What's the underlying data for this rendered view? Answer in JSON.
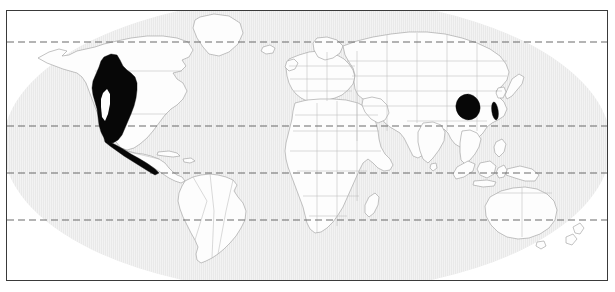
{
  "figure": {
    "type": "distribution-map",
    "title": "",
    "caption": "",
    "projection": "Robinson-like elliptical world projection",
    "background_color": "#ffffff",
    "ocean_color": "#e9e9e9",
    "land_color": "#fdfdfd",
    "land_outline_color": "#9a9a9a",
    "country_border_color": "#b4b4b4",
    "range_color": "#070707",
    "frame_color": "#3a3a3a"
  },
  "graticule": {
    "style": "dashed",
    "color": "#6b6b6b",
    "lines": [
      {
        "name": "arctic-circle",
        "label": "66.5°N",
        "y": 31
      },
      {
        "name": "tropic-of-cancer",
        "label": "23.5°N",
        "y": 115
      },
      {
        "name": "equator",
        "label": "0°",
        "y": 162
      },
      {
        "name": "tropic-of-capricorn",
        "label": "23.5°S",
        "y": 209
      }
    ]
  },
  "distribution": {
    "legend_label": "",
    "patches": [
      {
        "name": "north-american-range",
        "region": "Western North America",
        "description": "Coastal British Columbia south through the western United States into northwestern and central Mexico",
        "fill": "#070707"
      },
      {
        "name": "southeast-asian-range",
        "region": "Southwestern China / northern Myanmar",
        "description": "Yunnan, northern Myanmar and adjacent southwestern China uplands",
        "fill": "#070707"
      },
      {
        "name": "taiwan-range",
        "region": "Taiwan",
        "description": "Island of Taiwan",
        "fill": "#070707"
      }
    ]
  },
  "continents": [
    {
      "name": "north-america"
    },
    {
      "name": "south-america"
    },
    {
      "name": "greenland"
    },
    {
      "name": "europe"
    },
    {
      "name": "africa"
    },
    {
      "name": "asia"
    },
    {
      "name": "australia"
    },
    {
      "name": "new-zealand"
    },
    {
      "name": "japan"
    },
    {
      "name": "indonesia"
    },
    {
      "name": "madagascar"
    },
    {
      "name": "iceland"
    },
    {
      "name": "british-isles"
    },
    {
      "name": "antarctica"
    }
  ]
}
